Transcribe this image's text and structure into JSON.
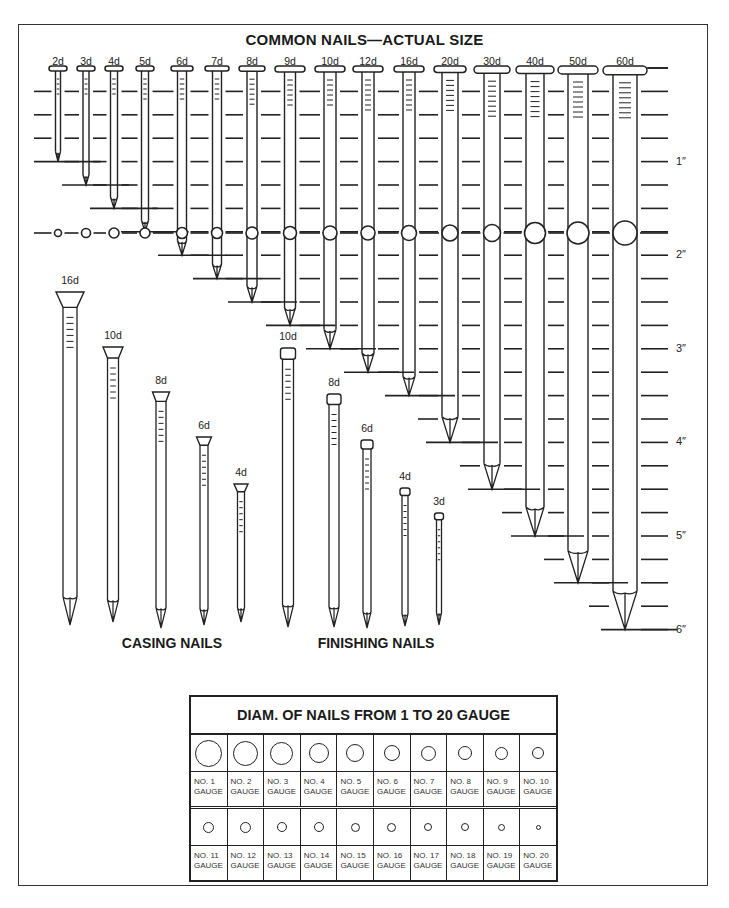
{
  "title": "COMMON NAILS—ACTUAL SIZE",
  "ruler": {
    "inch_labels": [
      "1″",
      "2″",
      "3″",
      "4″",
      "5″",
      "6″"
    ],
    "zero_y": 68,
    "px_per_inch": 93.6,
    "ticks_per_inch": 4
  },
  "common_nails": [
    {
      "label": "2d",
      "length_in": 1.0,
      "x": 58,
      "head_w": 18,
      "shank_w": 5,
      "circle_d": 7
    },
    {
      "label": "3d",
      "length_in": 1.25,
      "x": 86,
      "head_w": 18,
      "shank_w": 6,
      "circle_d": 9
    },
    {
      "label": "4d",
      "length_in": 1.5,
      "x": 114,
      "head_w": 18,
      "shank_w": 7,
      "circle_d": 10
    },
    {
      "label": "5d",
      "length_in": 1.75,
      "x": 145,
      "head_w": 18,
      "shank_w": 7,
      "circle_d": 10
    },
    {
      "label": "6d",
      "length_in": 2.0,
      "x": 182,
      "head_w": 22,
      "shank_w": 9,
      "circle_d": 11
    },
    {
      "label": "7d",
      "length_in": 2.25,
      "x": 217,
      "head_w": 24,
      "shank_w": 9,
      "circle_d": 11
    },
    {
      "label": "8d",
      "length_in": 2.5,
      "x": 252,
      "head_w": 26,
      "shank_w": 10,
      "circle_d": 12
    },
    {
      "label": "9d",
      "length_in": 2.75,
      "x": 290,
      "head_w": 30,
      "shank_w": 11,
      "circle_d": 13
    },
    {
      "label": "10d",
      "length_in": 3.0,
      "x": 330,
      "head_w": 30,
      "shank_w": 12,
      "circle_d": 14
    },
    {
      "label": "12d",
      "length_in": 3.25,
      "x": 368,
      "head_w": 30,
      "shank_w": 12,
      "circle_d": 14
    },
    {
      "label": "16d",
      "length_in": 3.5,
      "x": 409,
      "head_w": 30,
      "shank_w": 12,
      "circle_d": 15
    },
    {
      "label": "20d",
      "length_in": 4.0,
      "x": 450,
      "head_w": 32,
      "shank_w": 16,
      "circle_d": 16
    },
    {
      "label": "30d",
      "length_in": 4.5,
      "x": 492,
      "head_w": 36,
      "shank_w": 16,
      "circle_d": 17
    },
    {
      "label": "40d",
      "length_in": 5.0,
      "x": 535,
      "head_w": 38,
      "shank_w": 18,
      "circle_d": 21
    },
    {
      "label": "50d",
      "length_in": 5.5,
      "x": 578,
      "head_w": 40,
      "shank_w": 20,
      "circle_d": 22
    },
    {
      "label": "60d",
      "length_in": 6.0,
      "x": 625,
      "head_w": 44,
      "shank_w": 24,
      "circle_d": 24
    }
  ],
  "casing_nails": {
    "title": "CASING NAILS",
    "title_x": 172,
    "items": [
      {
        "label": "16d",
        "x": 70,
        "top": 292,
        "tip": 625,
        "head_w": 28,
        "shank_w": 14
      },
      {
        "label": "10d",
        "x": 113,
        "top": 347,
        "tip": 622,
        "head_w": 20,
        "shank_w": 11
      },
      {
        "label": "8d",
        "x": 161,
        "top": 392,
        "tip": 628,
        "head_w": 17,
        "shank_w": 10
      },
      {
        "label": "6d",
        "x": 204,
        "top": 437,
        "tip": 625,
        "head_w": 15,
        "shank_w": 8
      },
      {
        "label": "4d",
        "x": 241,
        "top": 484,
        "tip": 622,
        "head_w": 14,
        "shank_w": 7
      }
    ]
  },
  "finishing_nails": {
    "title": "FINISHING NAILS",
    "title_x": 376,
    "items": [
      {
        "label": "10d",
        "x": 288,
        "top": 348,
        "tip": 627,
        "head_w": 15,
        "shank_w": 11
      },
      {
        "label": "8d",
        "x": 334,
        "top": 394,
        "tip": 627,
        "head_w": 14,
        "shank_w": 10
      },
      {
        "label": "6d",
        "x": 367,
        "top": 440,
        "tip": 628,
        "head_w": 12,
        "shank_w": 8
      },
      {
        "label": "4d",
        "x": 405,
        "top": 488,
        "tip": 626,
        "head_w": 10,
        "shank_w": 6
      },
      {
        "label": "3d",
        "x": 439,
        "top": 513,
        "tip": 625,
        "head_w": 9,
        "shank_w": 5
      }
    ]
  },
  "gauge_table": {
    "title": "DIAM. OF NAILS FROM 1 TO 20 GAUGE",
    "row1": [
      {
        "label": "NO. 1 GAUGE",
        "line1": "NO. 1",
        "line2": "GAUGE",
        "d": 27
      },
      {
        "label": "NO. 2 GAUGE",
        "line1": "NO. 2",
        "line2": "GAUGE",
        "d": 25
      },
      {
        "label": "NO. 3 GAUGE",
        "line1": "NO. 3",
        "line2": "GAUGE",
        "d": 23
      },
      {
        "label": "NO. 4 GAUGE",
        "line1": "NO. 4",
        "line2": "GAUGE",
        "d": 20
      },
      {
        "label": "NO. 5 GAUGE",
        "line1": "NO. 5",
        "line2": "GAUGE",
        "d": 18
      },
      {
        "label": "NO. 6 GAUGE",
        "line1": "NO. 6",
        "line2": "GAUGE",
        "d": 16
      },
      {
        "label": "NO. 7 GAUGE",
        "line1": "NO. 7",
        "line2": "GAUGE",
        "d": 15
      },
      {
        "label": "NO. 8 GAUGE",
        "line1": "NO. 8",
        "line2": "GAUGE",
        "d": 14
      },
      {
        "label": "NO. 9 GAUGE",
        "line1": "NO. 9",
        "line2": "GAUGE",
        "d": 13
      },
      {
        "label": "NO. 10 GAUGE",
        "line1": "NO. 10",
        "line2": "GAUGE",
        "d": 12
      }
    ],
    "row2": [
      {
        "label": "NO. 11 GAUGE",
        "line1": "NO. 11",
        "line2": "GAUGE",
        "d": 11
      },
      {
        "label": "NO. 12 GAUGE",
        "line1": "NO. 12",
        "line2": "GAUGE",
        "d": 11
      },
      {
        "label": "NO. 13 GAUGE",
        "line1": "NO. 13",
        "line2": "GAUGE",
        "d": 10
      },
      {
        "label": "NO. 14 GAUGE",
        "line1": "NO. 14",
        "line2": "GAUGE",
        "d": 10
      },
      {
        "label": "NO. 15 GAUGE",
        "line1": "NO. 15",
        "line2": "GAUGE",
        "d": 9
      },
      {
        "label": "NO. 16 GAUGE",
        "line1": "NO. 16",
        "line2": "GAUGE",
        "d": 9
      },
      {
        "label": "NO. 17 GAUGE",
        "line1": "NO. 17",
        "line2": "GAUGE",
        "d": 8
      },
      {
        "label": "NO. 18 GAUGE",
        "line1": "NO. 18",
        "line2": "GAUGE",
        "d": 8
      },
      {
        "label": "NO. 19 GAUGE",
        "line1": "NO. 19",
        "line2": "GAUGE",
        "d": 7
      },
      {
        "label": "NO. 20 GAUGE",
        "line1": "NO. 20",
        "line2": "GAUGE",
        "d": 5
      }
    ]
  },
  "colors": {
    "ink": "#222222",
    "paper": "#ffffff",
    "frame": "#333333"
  }
}
